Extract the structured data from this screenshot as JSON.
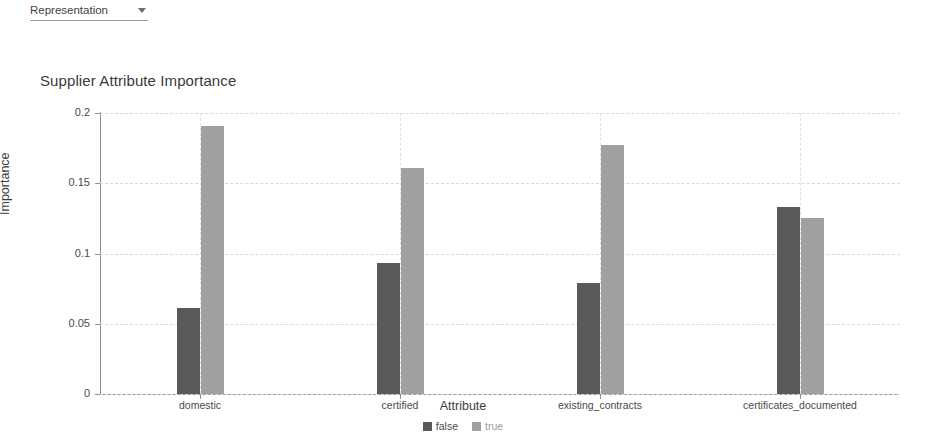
{
  "toolbar": {
    "representation_label": "Representation",
    "caret_icon": "chevron-down-icon"
  },
  "chart_data": {
    "type": "bar",
    "title": "Supplier Attribute Importance",
    "xlabel": "Attribute",
    "ylabel": "Importance",
    "categories": [
      "domestic",
      "certified",
      "existing_contracts",
      "certificates_documented"
    ],
    "series": [
      {
        "name": "false",
        "color": "#5a5a5a",
        "values": [
          0.061,
          0.093,
          0.079,
          0.133
        ]
      },
      {
        "name": "true",
        "color": "#a0a0a0",
        "values": [
          0.191,
          0.161,
          0.177,
          0.125
        ]
      }
    ],
    "ylim": [
      0,
      0.2
    ],
    "yticks": [
      0,
      0.05,
      0.1,
      0.15,
      0.2
    ],
    "ytick_labels": [
      "0",
      "0.05",
      "0.1",
      "0.15",
      "0.2"
    ],
    "grid": true,
    "legend_position": "bottom",
    "legend": [
      "false",
      "true"
    ]
  }
}
